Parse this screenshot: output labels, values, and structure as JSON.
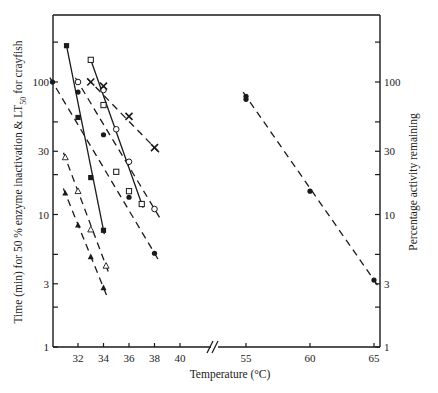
{
  "chart_data": {
    "type": "line",
    "title": "",
    "xlabel": "Temperature (°C)",
    "ylabel_left": "Time (min) for 50 % enzyme inactivation & LT50 for crayfish",
    "ylabel_left_parts": {
      "main": "Time (min) for 50 % enzyme inactivation & LT",
      "sub": "50",
      "tail": " for crayfish"
    },
    "ylabel_right": "Percentage activity remaining",
    "yscale": "log",
    "ylim": [
      1,
      300
    ],
    "x_tick_labels": [
      "32",
      "34",
      "36",
      "38",
      "40",
      "55",
      "60",
      "65"
    ],
    "x_ticks": [
      32,
      34,
      36,
      38,
      40,
      55,
      60,
      65
    ],
    "x_axis_break": "//",
    "y_tick_labels_left": [
      "1",
      "3",
      "10",
      "30",
      "100"
    ],
    "y_tick_labels_right": [
      "1",
      "3",
      "10",
      "30",
      "100"
    ],
    "y_ticks": [
      1,
      3,
      10,
      30,
      100
    ],
    "y_minor_ticks": [
      2,
      5,
      20,
      50,
      200
    ],
    "grid": false,
    "legend": null,
    "series": [
      {
        "name": "filled squares (solid)",
        "marker": "filled-square",
        "line": "solid",
        "x": [
          31.1,
          32,
          33,
          34
        ],
        "y": [
          188,
          54,
          19,
          7.6
        ]
      },
      {
        "name": "open squares (solid)",
        "marker": "open-square",
        "line": "solid",
        "x": [
          33,
          34,
          35,
          36,
          37
        ],
        "y": [
          147,
          67,
          21,
          15,
          12
        ]
      },
      {
        "name": "open circles (dashed)",
        "marker": "open-circle",
        "line": "dashed",
        "x": [
          32,
          34,
          35,
          36,
          38
        ],
        "y": [
          100,
          87,
          44,
          25,
          11
        ]
      },
      {
        "name": "filled circles (dashed)",
        "marker": "filled-circle",
        "line": "dashed",
        "x": [
          30,
          32,
          34,
          36,
          38
        ],
        "y": [
          100,
          84,
          40,
          13.5,
          5.1
        ]
      },
      {
        "name": "crosses (dashed)",
        "marker": "cross",
        "line": "dashed",
        "x": [
          33,
          34,
          36,
          38
        ],
        "y": [
          100,
          93,
          55,
          32
        ]
      },
      {
        "name": "open triangles (dashed)",
        "marker": "open-triangle",
        "line": "dashed",
        "x": [
          31,
          32,
          33,
          34.2
        ],
        "y": [
          27,
          15,
          7.7,
          4.1
        ]
      },
      {
        "name": "filled triangles (dashed)",
        "marker": "filled-triangle",
        "line": "dashed",
        "x": [
          31,
          32,
          33,
          34
        ],
        "y": [
          14.5,
          8.3,
          4.8,
          2.8
        ]
      },
      {
        "name": "percentage activity remaining (dashed)",
        "marker": "filled-circle",
        "line": "dashed",
        "axis": "right",
        "x": [
          55,
          55,
          60,
          65
        ],
        "y": [
          78,
          74,
          15,
          3.2
        ]
      }
    ]
  }
}
